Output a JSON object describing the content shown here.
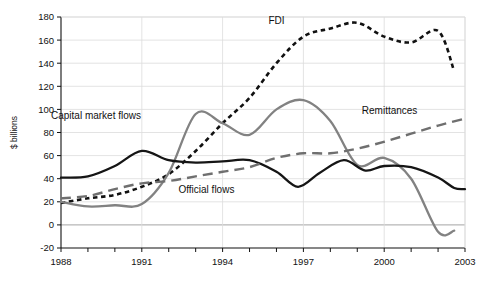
{
  "chart_data": {
    "type": "line",
    "title": "",
    "xlabel": "",
    "ylabel": "$ billions",
    "xlim": [
      1988,
      2003
    ],
    "ylim": [
      -20,
      180
    ],
    "grid": "both",
    "legend_position": "inline-annotations",
    "xticks": [
      1988,
      1989,
      1990,
      1991,
      1992,
      1993,
      1994,
      1995,
      1996,
      1997,
      1998,
      1999,
      2000,
      2001,
      2002,
      2003
    ],
    "xticklabels": [
      "1988",
      "",
      "",
      "1991",
      "",
      "",
      "1994",
      "",
      "",
      "1997",
      "",
      "",
      "2000",
      "",
      "",
      "2003"
    ],
    "yticks": [
      -20,
      0,
      20,
      40,
      60,
      80,
      100,
      120,
      140,
      160,
      180
    ],
    "yticklabels": [
      "-20",
      "0",
      "20",
      "40",
      "60",
      "80",
      "100",
      "120",
      "140",
      "160",
      "180"
    ],
    "x": [
      1988,
      1989,
      1990,
      1991,
      1992,
      1993,
      1994,
      1995,
      1996,
      1997,
      1998,
      1999,
      2000,
      2001,
      2002
    ],
    "series": [
      {
        "name": "FDI",
        "label": "FDI",
        "style": "dotted",
        "color": "#111111",
        "label_x": 1996.0,
        "label_y": 174,
        "values": [
          19,
          23,
          26,
          33,
          44,
          64,
          88,
          110,
          140,
          163,
          170,
          175,
          163,
          158,
          168,
          133
        ],
        "x_values": [
          1988,
          1989,
          1990,
          1991,
          1992,
          1993,
          1994,
          1995,
          1996,
          1997,
          1998,
          1999,
          2000,
          2001,
          2002,
          2002.6
        ]
      },
      {
        "name": "capital-market-flows",
        "label": "Capital market flows",
        "style": "solid",
        "color": "#828282",
        "label_x": 1989.3,
        "label_y": 92,
        "values": [
          20,
          16,
          17,
          18,
          45,
          96,
          88,
          78,
          100,
          108,
          90,
          52,
          58,
          40,
          -6,
          -5
        ],
        "x_values": [
          1988,
          1989,
          1990,
          1991,
          1992,
          1993,
          1994,
          1995,
          1996,
          1997,
          1998,
          1999,
          2000,
          2001,
          2002,
          2002.6
        ]
      },
      {
        "name": "official-flows",
        "label": "Official flows",
        "style": "solid",
        "color": "#151515",
        "label_x": 1993.4,
        "label_y": 28,
        "values": [
          41,
          42,
          51,
          64,
          56,
          54,
          55,
          56,
          46,
          33,
          45,
          56,
          47,
          51,
          50,
          41,
          32,
          31
        ],
        "x_values": [
          1988,
          1989,
          1990,
          1991,
          1992,
          1993,
          1994,
          1995,
          1996,
          1996.8,
          1997.6,
          1998.5,
          1999.3,
          2000,
          2001,
          2002,
          2002.6,
          2003
        ]
      },
      {
        "name": "remittances",
        "label": "Remittances",
        "style": "dashed",
        "color": "#6f6f6f",
        "label_x": 2000.2,
        "label_y": 96,
        "values": [
          23,
          25,
          31,
          36,
          38,
          42,
          46,
          50,
          58,
          62,
          62,
          66,
          72,
          79,
          86,
          92
        ],
        "x_values": [
          1988,
          1989,
          1990,
          1991,
          1992,
          1993,
          1994,
          1995,
          1996,
          1997,
          1998,
          1999,
          2000,
          2001,
          2002,
          2003
        ]
      }
    ]
  }
}
